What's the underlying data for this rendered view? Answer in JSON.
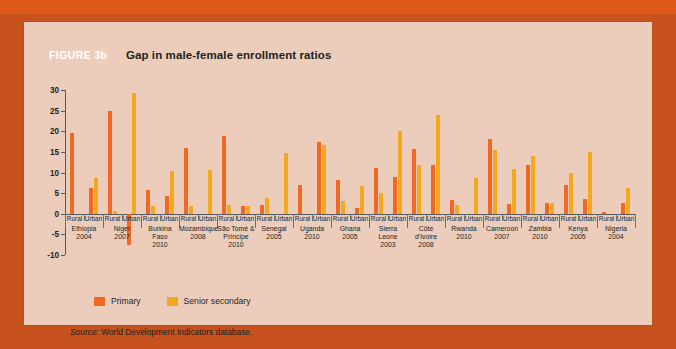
{
  "figure": {
    "number": "FIGURE 3b",
    "title": "Gap in male-female enrollment ratios"
  },
  "legend": {
    "items": [
      {
        "label": "Primary",
        "color": "#f26722"
      },
      {
        "label": "Senior secondary",
        "color": "#f4a81d"
      }
    ]
  },
  "source": {
    "label": "Source:",
    "text": "World Development Indicators database."
  },
  "colors": {
    "card_background": "#eccdbc",
    "page_background": "#c8521d",
    "top_band": "#e0591c",
    "primary": "#f26722",
    "senior_secondary": "#f4a81d",
    "axis": "#58595b",
    "text": "#231f20",
    "figure_number_text": "#ffffff"
  },
  "chart_data": {
    "type": "bar",
    "title": "Gap in male-female enrollment ratios",
    "xlabel": "",
    "ylabel": "",
    "ylim": [
      -10,
      30
    ],
    "yticks": [
      -10,
      -5,
      0,
      5,
      10,
      15,
      20,
      25,
      30
    ],
    "grid": false,
    "legend_position": "bottom-left",
    "series": [
      {
        "name": "Primary",
        "color": "#f26722"
      },
      {
        "name": "Senior secondary",
        "color": "#f4a81d"
      }
    ],
    "groups": [
      {
        "country": "Ethiopia",
        "year": "2004",
        "bars": [
          {
            "area": "Rural",
            "primary": 19.5,
            "senior_secondary": 0.0
          },
          {
            "area": "Urban",
            "primary": 6.2,
            "senior_secondary": 8.6
          }
        ]
      },
      {
        "country": "Niger",
        "year": "2007",
        "bars": [
          {
            "area": "Rural",
            "primary": 25.0,
            "senior_secondary": 0.7
          },
          {
            "area": "Urban",
            "primary": -7.5,
            "senior_secondary": 29.2
          }
        ]
      },
      {
        "country": "Burkina Faso",
        "year": "2010",
        "bars": [
          {
            "area": "Rural",
            "primary": 5.7,
            "senior_secondary": 1.8
          },
          {
            "area": "Urban",
            "primary": 4.2,
            "senior_secondary": 10.3
          }
        ]
      },
      {
        "country": "Mozambique",
        "year": "2008",
        "bars": [
          {
            "area": "Rural",
            "primary": 16.0,
            "senior_secondary": 2.0
          },
          {
            "area": "Urban",
            "primary": 0.0,
            "senior_secondary": 10.7
          }
        ]
      },
      {
        "country": "São Tomé & Príncipe",
        "year": "2010",
        "bars": [
          {
            "area": "Rural",
            "primary": 18.8,
            "senior_secondary": 2.1
          },
          {
            "area": "Urban",
            "primary": 1.8,
            "senior_secondary": 1.8
          }
        ]
      },
      {
        "country": "Senegal",
        "year": "2005",
        "bars": [
          {
            "area": "Rural",
            "primary": 2.2,
            "senior_secondary": 3.7
          },
          {
            "area": "Urban",
            "primary": 0.0,
            "senior_secondary": 14.7
          }
        ]
      },
      {
        "country": "Uganda",
        "year": "2010",
        "bars": [
          {
            "area": "Rural",
            "primary": 7.0,
            "senior_secondary": 0.0
          },
          {
            "area": "Urban",
            "primary": 17.4,
            "senior_secondary": 16.6
          }
        ]
      },
      {
        "country": "Ghana",
        "year": "2005",
        "bars": [
          {
            "area": "Rural",
            "primary": 8.2,
            "senior_secondary": 3.2
          },
          {
            "area": "Urban",
            "primary": 1.3,
            "senior_secondary": 6.8
          }
        ]
      },
      {
        "country": "Sierra Leone",
        "year": "2003",
        "bars": [
          {
            "area": "Rural",
            "primary": 11.0,
            "senior_secondary": 5.0
          },
          {
            "area": "Urban",
            "primary": 9.0,
            "senior_secondary": 20.0
          }
        ]
      },
      {
        "country": "Côte d'Ivoire",
        "year": "2008",
        "bars": [
          {
            "area": "Rural",
            "primary": 15.6,
            "senior_secondary": 11.7
          },
          {
            "area": "Urban",
            "primary": 11.8,
            "senior_secondary": 23.9
          }
        ]
      },
      {
        "country": "Rwanda",
        "year": "2010",
        "bars": [
          {
            "area": "Rural",
            "primary": 3.3,
            "senior_secondary": 2.2
          },
          {
            "area": "Urban",
            "primary": 0.0,
            "senior_secondary": 8.7
          }
        ]
      },
      {
        "country": "Cameroon",
        "year": "2007",
        "bars": [
          {
            "area": "Rural",
            "primary": 18.2,
            "senior_secondary": 15.5
          },
          {
            "area": "Urban",
            "primary": 2.4,
            "senior_secondary": 10.9
          }
        ]
      },
      {
        "country": "Zambia",
        "year": "2010",
        "bars": [
          {
            "area": "Rural",
            "primary": 11.9,
            "senior_secondary": 14.0
          },
          {
            "area": "Urban",
            "primary": 2.6,
            "senior_secondary": 2.6
          }
        ]
      },
      {
        "country": "Kenya",
        "year": "2005",
        "bars": [
          {
            "area": "Rural",
            "primary": 7.0,
            "senior_secondary": 10.0
          },
          {
            "area": "Urban",
            "primary": 3.6,
            "senior_secondary": 14.9
          }
        ]
      },
      {
        "country": "Nigeria",
        "year": "2004",
        "bars": [
          {
            "area": "Rural",
            "primary": 0.4,
            "senior_secondary": 0.0
          },
          {
            "area": "Urban",
            "primary": 2.7,
            "senior_secondary": 6.2
          }
        ]
      }
    ]
  }
}
